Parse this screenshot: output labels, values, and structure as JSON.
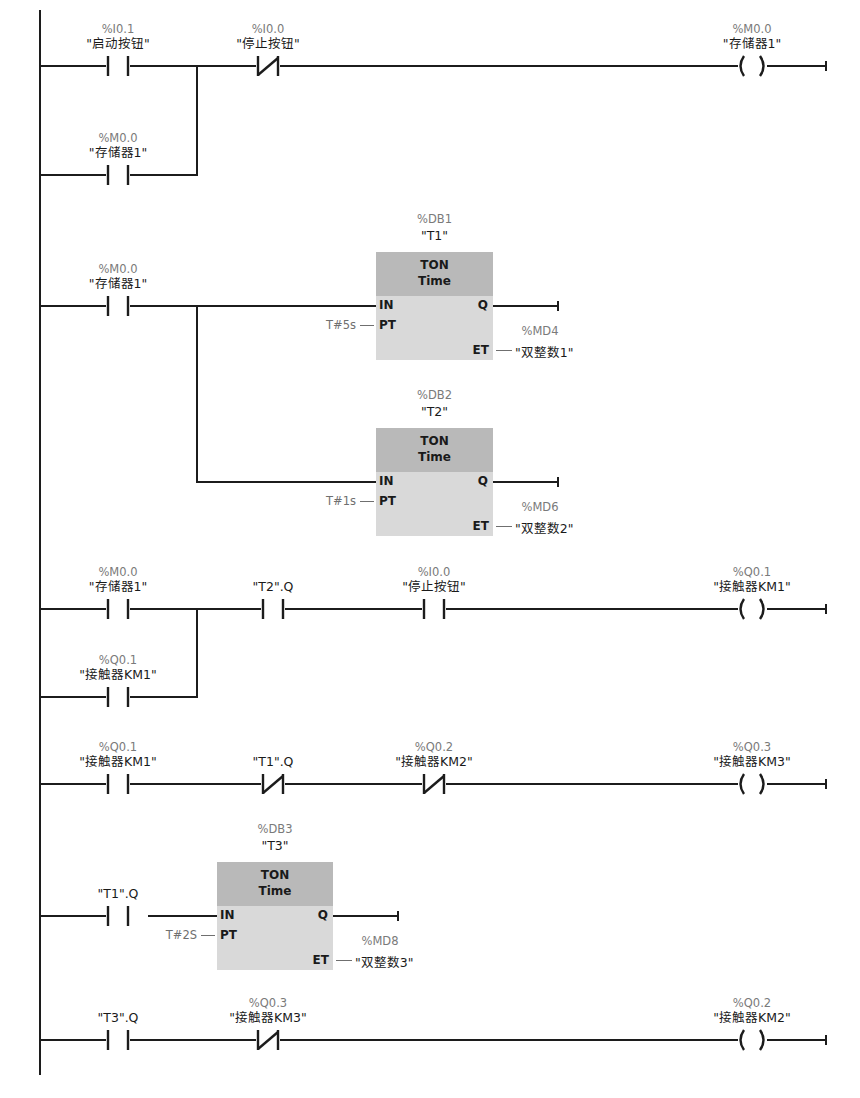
{
  "diagram": {
    "type": "ladder-logic",
    "power_rail": {
      "x": 40,
      "y_top": 10,
      "y_bottom": 1075
    },
    "rung_end_x": 826
  },
  "networks": [
    {
      "id": "rung1",
      "elements": [
        {
          "kind": "contact_no",
          "x": 118,
          "y": 66,
          "addr": "%I0.1",
          "symbol": "\"启动按钮\""
        },
        {
          "kind": "contact_nc",
          "x": 268,
          "y": 66,
          "addr": "%I0.0",
          "symbol": "\"停止按钮\""
        },
        {
          "kind": "coil",
          "x": 752,
          "y": 66,
          "addr": "%M0.0",
          "symbol": "\"存储器1\""
        },
        {
          "kind": "contact_no",
          "x": 118,
          "y": 175,
          "addr": "%M0.0",
          "symbol": "\"存储器1\"",
          "branch": true
        }
      ],
      "branch": {
        "x": 197,
        "y_top": 66,
        "y_bottom": 175
      }
    },
    {
      "id": "rung2",
      "elements": [
        {
          "kind": "contact_no",
          "x": 118,
          "y": 306,
          "addr": "%M0.0",
          "symbol": "\"存储器1\""
        }
      ],
      "branch": {
        "x": 197,
        "y_top": 306,
        "y_bottom": 482
      }
    },
    {
      "id": "rung3",
      "elements": [
        {
          "kind": "contact_no",
          "x": 118,
          "y": 609,
          "addr": "%M0.0",
          "symbol": "\"存储器1\""
        },
        {
          "kind": "contact_no",
          "x": 273,
          "y": 609,
          "addr": "",
          "symbol": "\"T2\".Q"
        },
        {
          "kind": "contact_no",
          "x": 434,
          "y": 609,
          "addr": "%I0.0",
          "symbol": "\"停止按钮\""
        },
        {
          "kind": "coil",
          "x": 752,
          "y": 609,
          "addr": "%Q0.1",
          "symbol": "\"接触器KM1\""
        },
        {
          "kind": "contact_no",
          "x": 118,
          "y": 697,
          "addr": "%Q0.1",
          "symbol": "\"接触器KM1\"",
          "branch": true
        }
      ],
      "branch": {
        "x": 197,
        "y_top": 609,
        "y_bottom": 697
      }
    },
    {
      "id": "rung4",
      "elements": [
        {
          "kind": "contact_no",
          "x": 118,
          "y": 784,
          "addr": "%Q0.1",
          "symbol": "\"接触器KM1\""
        },
        {
          "kind": "contact_nc",
          "x": 273,
          "y": 784,
          "addr": "",
          "symbol": "\"T1\".Q"
        },
        {
          "kind": "contact_nc",
          "x": 434,
          "y": 784,
          "addr": "%Q0.2",
          "symbol": "\"接触器KM2\""
        },
        {
          "kind": "coil",
          "x": 752,
          "y": 784,
          "addr": "%Q0.3",
          "symbol": "\"接触器KM3\""
        }
      ]
    },
    {
      "id": "rung5",
      "elements": [
        {
          "kind": "contact_no",
          "x": 118,
          "y": 916,
          "addr": "",
          "symbol": "\"T1\".Q"
        }
      ]
    },
    {
      "id": "rung6",
      "elements": [
        {
          "kind": "contact_no",
          "x": 118,
          "y": 1040,
          "addr": "",
          "symbol": "\"T3\".Q"
        },
        {
          "kind": "contact_nc",
          "x": 268,
          "y": 1040,
          "addr": "%Q0.3",
          "symbol": "\"接触器KM3\""
        },
        {
          "kind": "coil",
          "x": 752,
          "y": 1040,
          "addr": "%Q0.2",
          "symbol": "\"接触器KM2\""
        }
      ]
    }
  ],
  "timers": [
    {
      "id": "T1",
      "instance_addr": "%DB1",
      "instance_name": "\"T1\"",
      "type_line1": "TON",
      "type_line2": "Time",
      "x": 376,
      "y": 252,
      "w": 117,
      "h": 108,
      "in_y": 306,
      "in_from_x": 197,
      "pins": {
        "in": "IN",
        "pt": "PT",
        "q": "Q",
        "et": "ET"
      },
      "pt_value": "T#5s",
      "q_end_x": 558,
      "et_addr": "%MD4",
      "et_symbol": "\"双整数1\""
    },
    {
      "id": "T2",
      "instance_addr": "%DB2",
      "instance_name": "\"T2\"",
      "type_line1": "TON",
      "type_line2": "Time",
      "x": 376,
      "y": 428,
      "w": 117,
      "h": 108,
      "in_y": 482,
      "in_from_x": 197,
      "pins": {
        "in": "IN",
        "pt": "PT",
        "q": "Q",
        "et": "ET"
      },
      "pt_value": "T#1s",
      "q_end_x": 558,
      "et_addr": "%MD6",
      "et_symbol": "\"双整数2\""
    },
    {
      "id": "T3",
      "instance_addr": "%DB3",
      "instance_name": "\"T3\"",
      "type_line1": "TON",
      "type_line2": "Time",
      "x": 217,
      "y": 862,
      "w": 116,
      "h": 108,
      "in_y": 916,
      "in_from_x": 148,
      "pins": {
        "in": "IN",
        "pt": "PT",
        "q": "Q",
        "et": "ET"
      },
      "pt_value": "T#2S",
      "q_end_x": 398,
      "et_addr": "%MD8",
      "et_symbol": "\"双整数3\""
    }
  ]
}
